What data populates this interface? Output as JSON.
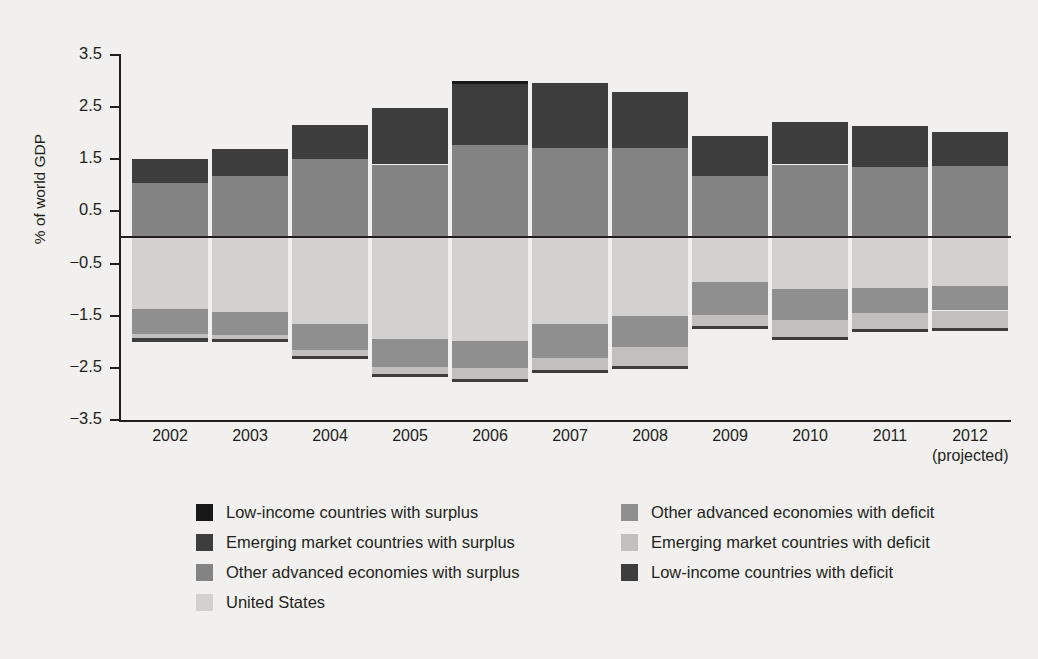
{
  "chart_data": {
    "type": "bar",
    "subtype": "stacked-diverging",
    "title": "",
    "xlabel": "",
    "ylabel": "% of world GDP",
    "ylim": [
      -3.5,
      3.5
    ],
    "yticks": [
      3.5,
      2.5,
      1.5,
      0.5,
      -0.5,
      -1.5,
      -2.5,
      -3.5
    ],
    "ytick_labels": [
      "3.5",
      "2.5",
      "1.5",
      "0.5",
      "−0.5",
      "−1.5",
      "−2.5",
      "−3.5"
    ],
    "grid": false,
    "zero_line": true,
    "legend_position": "bottom",
    "categories": [
      "2002",
      "2003",
      "2004",
      "2005",
      "2006",
      "2007",
      "2008",
      "2009",
      "2010",
      "2011",
      "2012"
    ],
    "category_sublabels": [
      "",
      "",
      "",
      "",
      "",
      "",
      "",
      "",
      "",
      "",
      "(projected)"
    ],
    "series": [
      {
        "name": "Low-income countries with surplus",
        "key": "low_income_surplus",
        "color": "#181818",
        "values": [
          0.0,
          0.0,
          0.0,
          0.0,
          0.06,
          0.0,
          0.0,
          0.0,
          0.0,
          0.0,
          0.0
        ]
      },
      {
        "name": "Emerging market countries with surplus",
        "key": "emerging_surplus",
        "color": "#3d3d3d",
        "values": [
          0.46,
          0.52,
          0.66,
          1.08,
          1.16,
          1.25,
          1.08,
          0.77,
          0.82,
          0.77,
          0.65
        ]
      },
      {
        "name": "Other advanced economies with surplus",
        "key": "other_advanced_surplus",
        "color": "#838383",
        "values": [
          1.04,
          1.18,
          1.5,
          1.4,
          1.78,
          1.71,
          1.72,
          1.18,
          1.4,
          1.36,
          1.38
        ]
      },
      {
        "name": "United States",
        "key": "united_states",
        "color": "#d2d1cf",
        "values": [
          -1.38,
          -1.42,
          -1.66,
          -1.95,
          -1.98,
          -1.66,
          -1.5,
          -0.86,
          -0.98,
          -0.97,
          -0.93
        ]
      },
      {
        "name": "Other advanced economies with deficit",
        "key": "other_advanced_deficit",
        "color": "#8f8f8f",
        "values": [
          -0.47,
          -0.45,
          -0.5,
          -0.53,
          -0.52,
          -0.66,
          -0.6,
          -0.63,
          -0.6,
          -0.48,
          -0.47
        ]
      },
      {
        "name": "Emerging market countries with deficit",
        "key": "emerging_deficit",
        "color": "#c1c0be",
        "values": [
          -0.08,
          -0.08,
          -0.11,
          -0.13,
          -0.22,
          -0.22,
          -0.37,
          -0.2,
          -0.32,
          -0.3,
          -0.33
        ]
      },
      {
        "name": "Low-income countries with deficit",
        "key": "low_income_deficit",
        "color": "#3d3d3d",
        "values": [
          -0.07,
          -0.06,
          -0.06,
          -0.06,
          -0.05,
          -0.06,
          -0.05,
          -0.06,
          -0.06,
          -0.06,
          -0.06
        ]
      }
    ],
    "totals_surplus": [
      1.5,
      1.7,
      2.16,
      2.48,
      3.0,
      2.96,
      2.8,
      1.95,
      2.22,
      2.13,
      2.03
    ],
    "totals_deficit": [
      -2.0,
      -2.01,
      -2.33,
      -2.67,
      -2.77,
      -2.6,
      -2.52,
      -1.75,
      -1.96,
      -1.81,
      -1.79
    ],
    "legend": {
      "left_column": [
        "Low-income countries with surplus",
        "Emerging market countries with surplus",
        "Other advanced economies with surplus",
        "United States"
      ],
      "right_column": [
        "Other advanced economies with deficit",
        "Emerging market countries with deficit",
        "Low-income countries with deficit"
      ],
      "left_colors": [
        "#181818",
        "#3d3d3d",
        "#838383",
        "#d2d1cf"
      ],
      "right_colors": [
        "#8f8f8f",
        "#c1c0be",
        "#3d3d3d"
      ]
    },
    "colors": {
      "background": "#f1f0ee",
      "axis": "#231f20",
      "text": "#231f20"
    }
  }
}
